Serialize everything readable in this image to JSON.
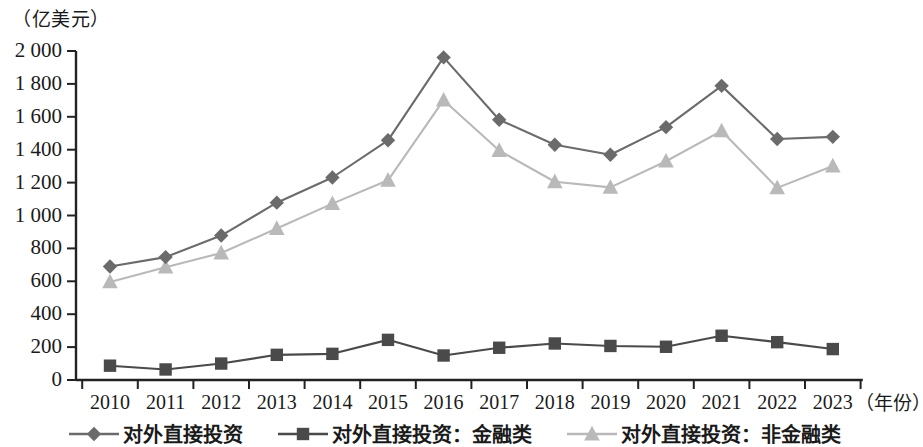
{
  "chart_data": {
    "type": "line",
    "title": "",
    "unit_label": "（亿美元）",
    "xlabel": "（年份）",
    "ylabel": "",
    "categories": [
      "2010",
      "2011",
      "2012",
      "2013",
      "2014",
      "2015",
      "2016",
      "2017",
      "2018",
      "2019",
      "2020",
      "2021",
      "2022",
      "2023"
    ],
    "series": [
      {
        "name": "对外直接投资",
        "marker": "diamond",
        "color": "#6b6b6b",
        "values": [
          690,
          747,
          878,
          1078,
          1231,
          1457,
          1961,
          1582,
          1430,
          1369,
          1537,
          1788,
          1465,
          1478
        ]
      },
      {
        "name": "对外直接投资：金融类",
        "marker": "square",
        "color": "#4a4a4a",
        "values": [
          87,
          64,
          100,
          153,
          159,
          244,
          149,
          196,
          222,
          207,
          202,
          269,
          230,
          188
        ]
      },
      {
        "name": "对外直接投资：非金融类",
        "marker": "triangle",
        "color": "#b9b9b9",
        "values": [
          596,
          686,
          772,
          921,
          1072,
          1214,
          1701,
          1395,
          1205,
          1171,
          1330,
          1514,
          1168,
          1301
        ]
      }
    ],
    "y_ticks": [
      "0",
      "200",
      "400",
      "600",
      "800",
      "1 000",
      "1 200",
      "1 400",
      "1 600",
      "1 800",
      "2 000"
    ],
    "y_tick_values": [
      0,
      200,
      400,
      600,
      800,
      1000,
      1200,
      1400,
      1600,
      1800,
      2000
    ],
    "ylim": [
      0,
      2000
    ],
    "grid": false,
    "legend_position": "bottom"
  },
  "legend": {
    "entries": [
      {
        "label": "对外直接投资",
        "marker": "diamond-marker",
        "color": "#6b6b6b"
      },
      {
        "label": "对外直接投资：金融类",
        "marker": "square-marker",
        "color": "#4a4a4a"
      },
      {
        "label": "对外直接投资：非金融类",
        "marker": "triangle-marker",
        "color": "#b9b9b9"
      }
    ]
  },
  "axes": {
    "axis_color": "#222222",
    "unit_caption": "（亿美元）",
    "year_caption": "（年份）"
  }
}
